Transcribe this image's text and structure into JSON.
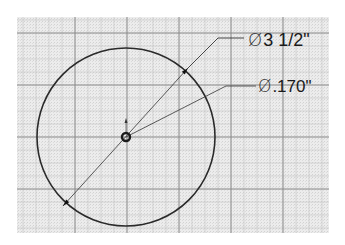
{
  "drawing": {
    "type": "cad-sketch",
    "grid": {
      "left": 17,
      "top": 17,
      "right": 329,
      "bottom": 233,
      "minor_spacing": 13,
      "major_spacing": 52,
      "major_x": [
        75,
        127,
        179,
        231,
        283
      ],
      "major_y": [
        33,
        85,
        137,
        189
      ],
      "background": "#e6e6e6",
      "minor_color": "#c8c8c8",
      "major_color": "#8a8a8a"
    },
    "outer_circle": {
      "cx": 126,
      "cy": 137,
      "r": 89,
      "stroke": "#2a2a2a"
    },
    "inner_hole": {
      "cx": 126,
      "cy": 137,
      "r": 4,
      "stroke": "#1a1a1a"
    },
    "dimensions": [
      {
        "id": "outer-diameter",
        "symbol": "Ø",
        "value": "3 1/2\"",
        "leader": {
          "x1": 63,
          "y1": 206,
          "x2": 188,
          "y2": 68,
          "bend_x": 218,
          "bend_y": 38,
          "end_x": 244
        },
        "label_x": 248,
        "label_y": 31,
        "font_size": 18
      },
      {
        "id": "hole-diameter",
        "symbol": "Ø",
        "value": ".170\"",
        "leader": {
          "x1": 126,
          "y1": 137,
          "bend_x": 226,
          "bend_y": 86,
          "end_x": 256
        },
        "label_x": 258,
        "label_y": 78,
        "font_size": 17
      }
    ]
  }
}
